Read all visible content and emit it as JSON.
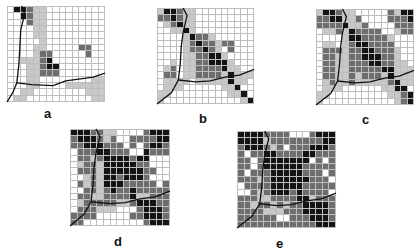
{
  "figure": {
    "legend_levels": {
      "0": "#ffffff",
      "1": "#c8c8c8",
      "2": "#6e6e6e",
      "3": "#141414"
    },
    "panels": [
      {
        "label": "a",
        "box": {
          "x": 7,
          "y": 6,
          "w": 98,
          "h": 96
        },
        "label_pos": {
          "x": 44,
          "y": 106
        },
        "cells": [
          "033211000000000",
          "003211000000000",
          "000211000000000",
          "000011000000000",
          "000011000000000",
          "000001000000000",
          "000011000002200",
          "000012200000200",
          "001112300000000",
          "000112330000000",
          "000112220000000",
          "000110000000011",
          "000110000111111",
          "001100000000111",
          "011000000000011"
        ],
        "river": [
          [
            [
              15,
              0
            ],
            [
              18,
              8
            ],
            [
              14,
              25
            ],
            [
              13,
              45
            ],
            [
              12,
              62
            ],
            [
              10,
              80
            ],
            [
              6,
              90
            ],
            [
              0,
              100
            ]
          ],
          [
            [
              10,
              80
            ],
            [
              25,
              82
            ],
            [
              47,
              83
            ],
            [
              60,
              78
            ],
            [
              75,
              76
            ],
            [
              88,
              74
            ],
            [
              100,
              70
            ]
          ]
        ]
      },
      {
        "label": "b",
        "box": {
          "x": 157,
          "y": 8,
          "w": 97,
          "h": 96
        },
        "label_pos": {
          "x": 199,
          "y": 111
        },
        "cells": [
          "133211000000000",
          "223211000000000",
          "012311000000000",
          "001131000000000",
          "000013221000000",
          "000012322122000",
          "000012232102000",
          "000011223310000",
          "001011223331000",
          "012011222231100",
          "022011222213111",
          "011110111113110",
          "011100000011300",
          "110000000001130",
          "100000000000013"
        ],
        "river": [
          [
            [
              27,
              0
            ],
            [
              31,
              8
            ],
            [
              27,
              25
            ],
            [
              25,
              40
            ],
            [
              24,
              58
            ],
            [
              22,
              75
            ],
            [
              15,
              88
            ],
            [
              0,
              100
            ]
          ],
          [
            [
              22,
              75
            ],
            [
              40,
              77
            ],
            [
              55,
              76
            ],
            [
              70,
              72
            ],
            [
              85,
              70
            ],
            [
              100,
              64
            ]
          ]
        ]
      },
      {
        "label": "c",
        "box": {
          "x": 316,
          "y": 9,
          "w": 98,
          "h": 96
        },
        "label_pos": {
          "x": 362,
          "y": 112
        },
        "cells": [
          "133211000002133",
          "223311200002223",
          "222231120000222",
          "011213222200122",
          "000013322221000",
          "011012332222000",
          "022212233222100",
          "022112233322100",
          "022112223322110",
          "022112222233111",
          "022112122213111",
          "012112111112311",
          "011100000011330",
          "110000000001123",
          "100000000000123"
        ],
        "river": [
          [
            [
              27,
              0
            ],
            [
              31,
              8
            ],
            [
              27,
              25
            ],
            [
              25,
              40
            ],
            [
              24,
              58
            ],
            [
              22,
              75
            ],
            [
              15,
              88
            ],
            [
              0,
              100
            ]
          ],
          [
            [
              22,
              75
            ],
            [
              40,
              77
            ],
            [
              55,
              76
            ],
            [
              70,
              72
            ],
            [
              85,
              70
            ],
            [
              100,
              64
            ]
          ]
        ]
      },
      {
        "label": "d",
        "box": {
          "x": 70,
          "y": 129,
          "w": 100,
          "h": 97
        },
        "label_pos": {
          "x": 114,
          "y": 234
        },
        "cells": [
          "333221100002333",
          "233321200222233",
          "223332220202332",
          "022233222003222",
          "022123333233000",
          "012213333322000",
          "022213333332200",
          "001213323332000",
          "021213332222202",
          "002212322322222",
          "022112222311222",
          "012222211233322",
          "022211100023332",
          "222200000223332",
          "220000000002333"
        ],
        "river": [
          [
            [
              26,
              0
            ],
            [
              30,
              8
            ],
            [
              26,
              25
            ],
            [
              24,
              40
            ],
            [
              23,
              58
            ],
            [
              21,
              75
            ],
            [
              14,
              88
            ],
            [
              0,
              100
            ]
          ],
          [
            [
              21,
              75
            ],
            [
              40,
              77
            ],
            [
              55,
              76
            ],
            [
              70,
              72
            ],
            [
              85,
              70
            ],
            [
              100,
              64
            ]
          ]
        ]
      },
      {
        "label": "e",
        "box": {
          "x": 237,
          "y": 131,
          "w": 99,
          "h": 97
        },
        "label_pos": {
          "x": 276,
          "y": 236
        },
        "cells": [
          "333322220002333",
          "333312222222233",
          "233321202223332",
          "202233222233222",
          "220233333330202",
          "220233333322222",
          "202223333322202",
          "222123333332220",
          "022223333322222",
          "002123332322220",
          "222112222331222",
          "221221212233332",
          "222211122233332",
          "222222002223332",
          "222222222222333"
        ],
        "river": [
          [
            [
              28,
              0
            ],
            [
              32,
              8
            ],
            [
              28,
              25
            ],
            [
              26,
              40
            ],
            [
              25,
              58
            ],
            [
              23,
              75
            ],
            [
              15,
              88
            ],
            [
              0,
              100
            ]
          ],
          [
            [
              23,
              75
            ],
            [
              40,
              77
            ],
            [
              55,
              76
            ],
            [
              70,
              72
            ],
            [
              85,
              70
            ],
            [
              100,
              64
            ]
          ]
        ]
      }
    ]
  }
}
